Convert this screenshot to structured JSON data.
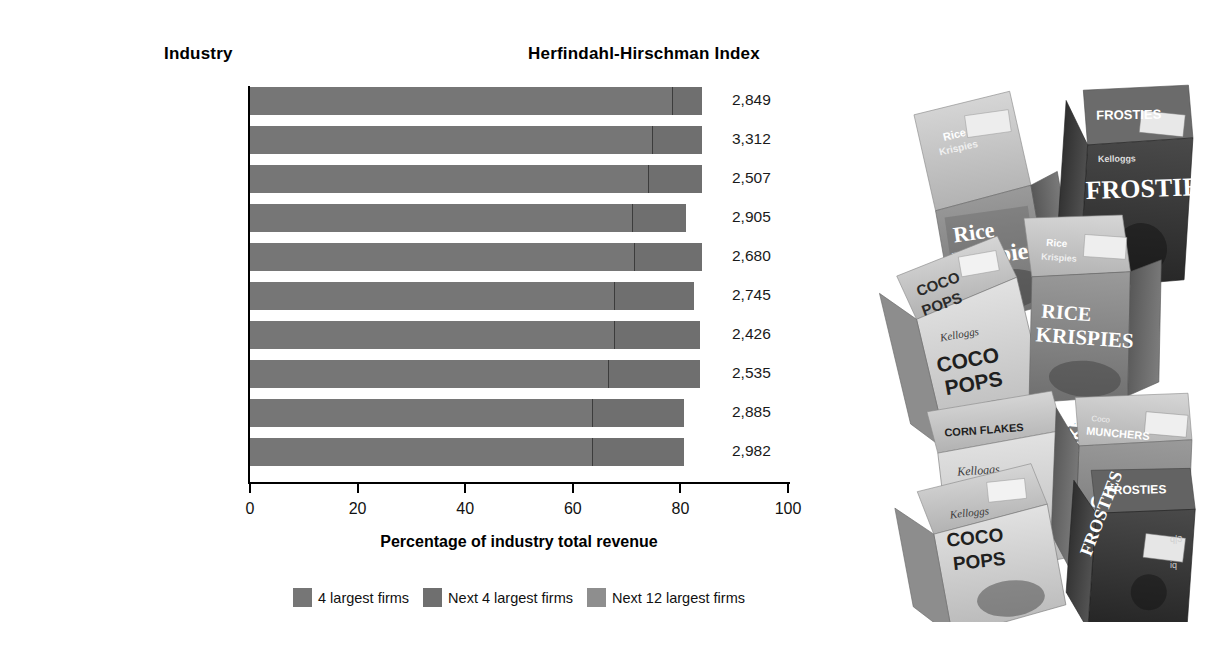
{
  "headers": {
    "industry": "Industry",
    "hhi": "Herfindahl-Hirschman Index"
  },
  "chart_data": {
    "type": "bar",
    "orientation": "horizontal",
    "stacked": true,
    "title": "",
    "xlabel": "Percentage of industry total revenue",
    "ylabel": "Industry",
    "xlim": [
      0,
      100
    ],
    "xticks": [
      0,
      20,
      40,
      60,
      80,
      100
    ],
    "xtick_labels": [
      "0",
      "20",
      "40",
      "60",
      "80",
      "100"
    ],
    "grid": false,
    "legend_position": "bottom-center",
    "legend": [
      "4 largest firms",
      "Next 4 largest firms",
      "Next 12 largest firms"
    ],
    "categories": [
      "Airplanes*",
      "Cigarettes*",
      "Glass containers",
      "Recording devices",
      "Light trucks",
      "Other tobacco products",
      "Breakfast cereals",
      "Petrochemicals",
      "Specialty cans",
      "Computer storage devices"
    ],
    "series": [
      {
        "name": "4 largest firms",
        "color": "#767676",
        "values": [
          78.4,
          74.7,
          74.0,
          71.0,
          71.4,
          67.7,
          67.7,
          66.5,
          63.6,
          63.6
        ]
      },
      {
        "name": "Next 4 largest firms",
        "color": "#6f6f6f",
        "values": [
          5.6,
          9.3,
          10.0,
          10.0,
          12.6,
          14.8,
          15.9,
          17.1,
          17.1,
          17.1
        ]
      },
      {
        "name": "Next 12 largest firms",
        "color": "#8e8e8e",
        "values": [
          0,
          0,
          0,
          0,
          0,
          0,
          0,
          0,
          0,
          0
        ]
      }
    ],
    "totals": [
      84.0,
      84.0,
      84.0,
      81.0,
      84.0,
      82.5,
      83.6,
      83.6,
      80.7,
      80.7
    ],
    "hhi_values": [
      "2,849",
      "3,312",
      "2,507",
      "2,905",
      "2,680",
      "2,745",
      "2,426",
      "2,535",
      "2,885",
      "2,982"
    ],
    "annotations": [
      "* indicates estimated value"
    ]
  },
  "rows": [
    {
      "label": "Airplanes*",
      "seg1": 78.4,
      "seg2": 5.6,
      "hhi": "2,849"
    },
    {
      "label": "Cigarettes*",
      "seg1": 74.7,
      "seg2": 9.3,
      "hhi": "3,312"
    },
    {
      "label": "Glass containers",
      "seg1": 74.0,
      "seg2": 10.0,
      "hhi": "2,507"
    },
    {
      "label": "Recording devices",
      "seg1": 71.0,
      "seg2": 10.0,
      "hhi": "2,905"
    },
    {
      "label": "Light trucks",
      "seg1": 71.4,
      "seg2": 12.6,
      "hhi": "2,680"
    },
    {
      "label": "Other tobacco products",
      "seg1": 67.7,
      "seg2": 14.8,
      "hhi": "2,745"
    },
    {
      "label": "Breakfast cereals",
      "seg1": 67.7,
      "seg2": 15.9,
      "hhi": "2,426"
    },
    {
      "label": "Petrochemicals",
      "seg1": 66.5,
      "seg2": 17.1,
      "hhi": "2,535"
    },
    {
      "label": "Specialty cans",
      "seg1": 63.6,
      "seg2": 17.1,
      "hhi": "2,885"
    },
    {
      "label": "Computer storage devices",
      "seg1": 63.6,
      "seg2": 17.1,
      "hhi": "2,982"
    }
  ],
  "axis": {
    "ticks": [
      "0",
      "20",
      "40",
      "60",
      "80",
      "100"
    ],
    "title": "Percentage of industry total revenue"
  },
  "legend": [
    {
      "label": "4 largest firms",
      "color": "#767676"
    },
    {
      "label": "Next 4 largest firms",
      "color": "#6f6f6f"
    },
    {
      "label": "Next 12 largest firms",
      "color": "#8e8e8e"
    }
  ],
  "photo": {
    "description": "Assorted Kellogg's breakfast cereal boxes",
    "boxes": [
      "Rice Krispies",
      "Frosties",
      "Coco Pops",
      "Rice Krispies",
      "Corn Flakes",
      "Coco Pops",
      "Coco Munchers",
      "Frosties"
    ]
  }
}
